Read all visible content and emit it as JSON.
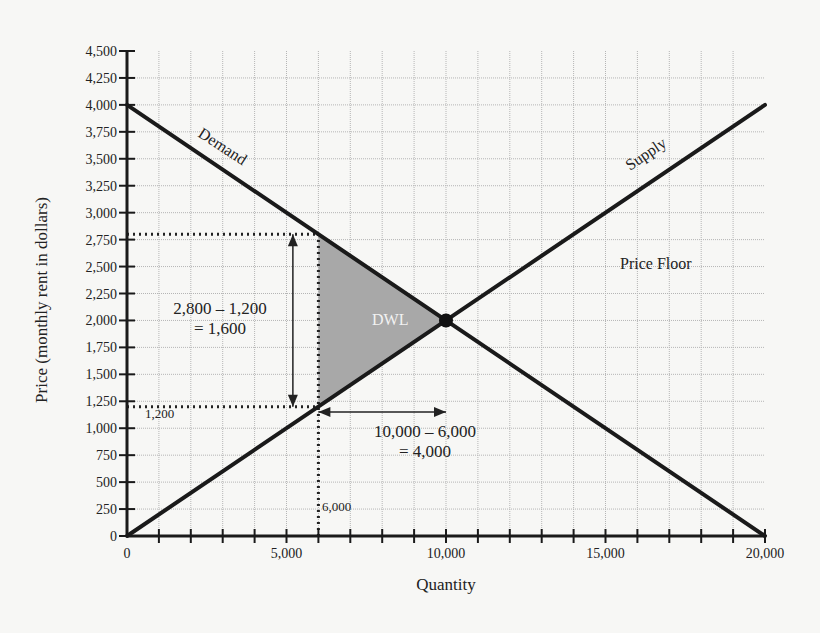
{
  "chart_data": {
    "type": "line",
    "title": "",
    "xlabel": "Quantity",
    "ylabel": "Price (monthly rent in dollars)",
    "xlim": [
      0,
      20000
    ],
    "ylim": [
      0,
      4500
    ],
    "grid": true,
    "x_ticks": [
      0,
      5000,
      10000,
      15000,
      20000
    ],
    "x_tick_labels": [
      "0",
      "5,000",
      "10,000",
      "15,000",
      "20,000"
    ],
    "x_minor_step": 1000,
    "y_ticks": [
      0,
      250,
      500,
      750,
      1000,
      1250,
      1500,
      1750,
      2000,
      2250,
      2500,
      2750,
      3000,
      3250,
      3500,
      3750,
      4000,
      4250,
      4500
    ],
    "y_tick_labels": [
      "0",
      "250",
      "500",
      "750",
      "1,000",
      "1,250",
      "1,500",
      "1,750",
      "2,000",
      "2,250",
      "2,500",
      "2,750",
      "3,000",
      "3,250",
      "3,500",
      "3,750",
      "4,000",
      "4,250",
      "4,500"
    ],
    "series": [
      {
        "name": "Demand",
        "x": [
          0,
          20000
        ],
        "y": [
          4000,
          0
        ]
      },
      {
        "name": "Supply",
        "x": [
          0,
          20000
        ],
        "y": [
          0,
          4000
        ]
      }
    ],
    "equilibrium": {
      "x": 10000,
      "y": 2000
    },
    "dwl_region": {
      "label": "DWL",
      "points": [
        [
          6000,
          2800
        ],
        [
          10000,
          2000
        ],
        [
          6000,
          1200
        ]
      ],
      "fill": "#a8a8a8"
    },
    "annotations": [
      {
        "text": "Demand",
        "x": 3000,
        "y": 3600,
        "rotation": 33
      },
      {
        "text": "Supply",
        "x": 16200,
        "y": 3500,
        "rotation": -33
      },
      {
        "text": "Price Floor",
        "x": 17400,
        "y": 2520
      },
      {
        "text": "2,800 – 1,200",
        "line2": "= 1,600",
        "x": 2500,
        "y": 2050
      },
      {
        "text": "10,000 – 6,000",
        "line2": "= 4,000",
        "x": 9400,
        "y": 950
      },
      {
        "text": "1,200",
        "x": 650,
        "y": 1100
      },
      {
        "text": "6,000",
        "x": 6800,
        "y": 250
      }
    ],
    "reference_lines": [
      {
        "type": "dotted",
        "from": [
          0,
          2800
        ],
        "to": [
          6000,
          2800
        ]
      },
      {
        "type": "dotted",
        "from": [
          0,
          1200
        ],
        "to": [
          6000,
          1200
        ]
      },
      {
        "type": "dotted",
        "from": [
          6000,
          0
        ],
        "to": [
          6000,
          2800
        ]
      }
    ],
    "arrows": [
      {
        "from": [
          5200,
          2800
        ],
        "to": [
          5200,
          1200
        ],
        "double": true
      },
      {
        "from": [
          6000,
          1150
        ],
        "to": [
          10000,
          1150
        ],
        "double": true
      }
    ]
  },
  "labels": {
    "xlabel": "Quantity",
    "ylabel": "Price (monthly rent in dollars)",
    "demand": "Demand",
    "supply": "Supply",
    "price_floor": "Price Floor",
    "dwl": "DWL",
    "price_diff_line1": "2,800 – 1,200",
    "price_diff_line2": "= 1,600",
    "qty_diff_line1": "10,000 – 6,000",
    "qty_diff_line2": "= 4,000",
    "price_1200": "1,200",
    "qty_6000": "6,000"
  },
  "colors": {
    "line": "#1a1a1a",
    "grid": "#b5b5b5",
    "dwl_fill": "#a8a8a8",
    "background": "#f7f7f5"
  }
}
